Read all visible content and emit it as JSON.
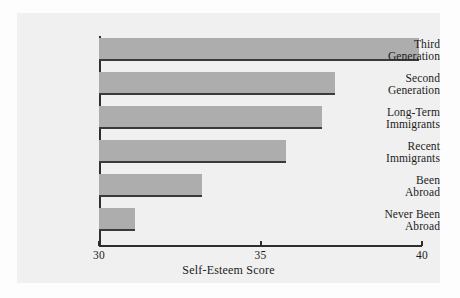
{
  "chart_data": {
    "type": "bar",
    "orientation": "horizontal",
    "title": "",
    "subtitle": "",
    "xlabel": "Self-Esteem Score",
    "ylabel": "",
    "xlim": [
      30,
      40
    ],
    "xticks": [
      30,
      35,
      40
    ],
    "xtick_labels": [
      "30",
      "35",
      "40"
    ],
    "grid": false,
    "legend": null,
    "bar_color": "#adadad",
    "bar_edge_color": "#3a3a3a",
    "background_color": "#f0f0f0",
    "categories": [
      "Third Generation",
      "Second Generation",
      "Long-Term Immigrants",
      "Recent Immigrants",
      "Been Abroad",
      "Never Been Abroad"
    ],
    "values": [
      39.9,
      37.3,
      36.9,
      35.8,
      33.2,
      31.1
    ],
    "bars": [
      {
        "line1": "Third",
        "line2": "Generation",
        "value": 39.9
      },
      {
        "line1": "Second",
        "line2": "Generation",
        "value": 37.3
      },
      {
        "line1": "Long-Term",
        "line2": "Immigrants",
        "value": 36.9
      },
      {
        "line1": "Recent",
        "line2": "Immigrants",
        "value": 35.8
      },
      {
        "line1": "Been",
        "line2": "Abroad",
        "value": 33.2
      },
      {
        "line1": "Never Been",
        "line2": "Abroad",
        "value": 31.1
      }
    ]
  }
}
